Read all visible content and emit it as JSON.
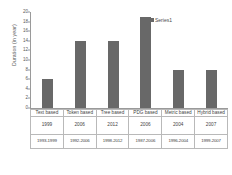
{
  "chart_data": {
    "type": "bar",
    "title": "",
    "xlabel": "",
    "ylabel": "Duration (in year)",
    "ylim": [
      0,
      20
    ],
    "yticks": [
      0,
      2,
      4,
      6,
      8,
      10,
      12,
      14,
      16,
      18,
      20
    ],
    "grid": false,
    "legend": {
      "position": "top-right",
      "entries": [
        "Series1"
      ]
    },
    "categories": [
      "Text based",
      "Token based",
      "Tree based",
      "PDG based",
      "Metric based",
      "Hybrid based"
    ],
    "series": [
      {
        "name": "Series1",
        "values": [
          6,
          14,
          14,
          19,
          8,
          8
        ],
        "color": "#686868"
      }
    ],
    "table": {
      "rows": [
        {
          "key": "category",
          "cells": [
            "Text based",
            "Token based",
            "Tree based",
            "PDG based",
            "Metric based",
            "Hybrid based"
          ]
        },
        {
          "key": "year",
          "cells": [
            "1999",
            "2006",
            "2012",
            "2006",
            "2004",
            "2007"
          ]
        },
        {
          "key": "range",
          "cells": [
            "1993-1999",
            "1992-2006",
            "1998-2012",
            "1987-2006",
            "1996-2004",
            "1999-2007"
          ]
        }
      ]
    }
  },
  "colors": {
    "bar": "#686868",
    "axis": "#9a9a9a",
    "grid_line": "#b9b9b9",
    "text": "#4a4a4a",
    "background": "#ffffff"
  }
}
